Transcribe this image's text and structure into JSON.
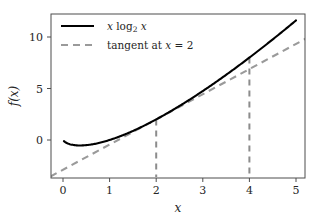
{
  "chart_data": {
    "type": "line",
    "title": "",
    "xlabel": "x",
    "ylabel": "f(x)",
    "xlim": [
      -0.27,
      5.27
    ],
    "ylim": [
      -3.6,
      12.3
    ],
    "xticks": [
      0,
      1,
      2,
      3,
      4,
      5
    ],
    "xticklabels": [
      "0",
      "1",
      "2",
      "3",
      "4",
      "5"
    ],
    "yticks": [
      0,
      5,
      10
    ],
    "yticklabels": [
      "0",
      "5",
      "10"
    ],
    "grid": false,
    "legend_position": "upper left",
    "series": [
      {
        "name": "x log2 x",
        "label_parts": {
          "lead": "x",
          "func": "log",
          "sub": "2",
          "arg": "x"
        },
        "style": "solid",
        "color": "#000000",
        "x": [
          0.02,
          0.1,
          0.2,
          0.3,
          0.37,
          0.5,
          0.7,
          1.0,
          1.3,
          1.6,
          2.0,
          2.5,
          3.0,
          3.5,
          4.0,
          4.5,
          5.0
        ],
        "y": [
          -0.113,
          -0.332,
          -0.464,
          -0.521,
          -0.531,
          -0.5,
          -0.36,
          0.0,
          0.492,
          1.085,
          2.0,
          3.305,
          4.755,
          6.324,
          8.0,
          9.768,
          11.61
        ]
      },
      {
        "name": "tangent at x = 2",
        "label_parts": {
          "lead": "tangent at",
          "var": "x",
          "eq": "=",
          "value": "2"
        },
        "style": "dashed",
        "color": "#9a9a9a",
        "slope": 2.4427,
        "intercept": -2.8854,
        "tangent_point": {
          "x": 2,
          "y": 2
        },
        "x": [
          -0.27,
          5.27
        ],
        "y": [
          -3.545,
          9.989
        ]
      }
    ],
    "droplines": [
      {
        "x": 2,
        "y_top": 2.0,
        "y_bottom": -3.6,
        "style": "dashed",
        "color": "#8c8c8c"
      },
      {
        "x": 4,
        "y_top": 8.0,
        "y_bottom": -3.6,
        "style": "dashed",
        "color": "#8c8c8c"
      }
    ],
    "annotations": []
  },
  "legend": {
    "entries": [
      {
        "text": "x log₂ x"
      },
      {
        "text": "tangent at x = 2"
      }
    ]
  },
  "colors": {
    "curve": "#000000",
    "tangent": "#9a9a9a",
    "dropline": "#8c8c8c",
    "axis": "#4d4d4d",
    "text": "#262626",
    "background": "#ffffff"
  }
}
